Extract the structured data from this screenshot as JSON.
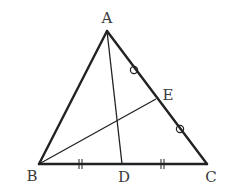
{
  "diagram": {
    "type": "triangle-geometry",
    "stroke_color": "#222222",
    "background": "#ffffff",
    "points": {
      "A": {
        "label": "A",
        "x": 107,
        "y": 31,
        "label_x": 107,
        "label_y": 23
      },
      "B": {
        "label": "B",
        "x": 39,
        "y": 164,
        "label_x": 32,
        "label_y": 181
      },
      "C": {
        "label": "C",
        "x": 207,
        "y": 164,
        "label_x": 211,
        "label_y": 182
      },
      "D": {
        "label": "D",
        "x": 122,
        "y": 164,
        "label_x": 124,
        "label_y": 182
      },
      "E": {
        "label": "E",
        "x": 156,
        "y": 99,
        "label_x": 168,
        "label_y": 100
      }
    },
    "segments": [
      {
        "from": "A",
        "to": "B",
        "weight": "thick"
      },
      {
        "from": "A",
        "to": "C",
        "weight": "thick"
      },
      {
        "from": "B",
        "to": "C",
        "weight": "thick"
      },
      {
        "from": "A",
        "to": "D",
        "weight": "thin"
      },
      {
        "from": "B",
        "to": "E",
        "weight": "thin"
      }
    ],
    "equal_marks": [
      {
        "type": "circle",
        "segment": "AE",
        "x": 134,
        "y": 70
      },
      {
        "type": "circle",
        "segment": "EC",
        "x": 180,
        "y": 129
      },
      {
        "type": "double-tick",
        "segment": "BD",
        "x": 80,
        "y": 164
      },
      {
        "type": "double-tick",
        "segment": "DC",
        "x": 162,
        "y": 164
      }
    ]
  }
}
